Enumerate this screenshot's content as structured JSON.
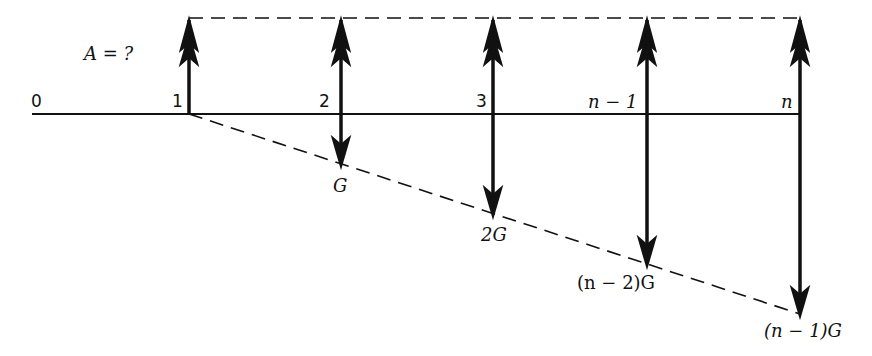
{
  "diagram": {
    "title_label": "A = ?",
    "periods": [
      {
        "label": "0"
      },
      {
        "label": "1"
      },
      {
        "label": "2"
      },
      {
        "label": "3"
      },
      {
        "label": "n − 1"
      },
      {
        "label": "n"
      }
    ],
    "gradient_labels": [
      {
        "label": "G"
      },
      {
        "label": "2G"
      },
      {
        "label": "(n − 2)G"
      },
      {
        "label": "(n − 1)G"
      }
    ]
  }
}
